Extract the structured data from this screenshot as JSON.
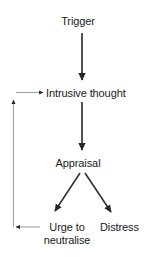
{
  "diagram": {
    "type": "flowchart",
    "title": "",
    "background_color": "#ffffff",
    "text_color": "#1a1a1a",
    "arrow_color_dark": "#262626",
    "arrow_color_light": "#9a9a9a",
    "nodes": [
      {
        "id": "trigger",
        "label": "Trigger",
        "x": 82,
        "y": 22
      },
      {
        "id": "intrusive_thought",
        "label": "Intrusive thought",
        "x": 88,
        "y": 93
      },
      {
        "id": "appraisal",
        "label": "Appraisal",
        "x": 82,
        "y": 164
      },
      {
        "id": "urge_to_neutralise",
        "label_line1": "Urge to",
        "label_line2": "neutralise",
        "x": 67,
        "y": 234
      },
      {
        "id": "distress",
        "label": "Distress",
        "x": 125,
        "y": 228
      }
    ],
    "edges": [
      {
        "from": "trigger",
        "to": "intrusive_thought",
        "style": "dark-vertical"
      },
      {
        "from": "intrusive_thought",
        "to": "appraisal",
        "style": "dark-vertical"
      },
      {
        "from": "appraisal",
        "to": "urge_to_neutralise",
        "style": "dark-diagonal"
      },
      {
        "from": "appraisal",
        "to": "distress",
        "style": "dark-diagonal"
      },
      {
        "from": "urge_to_neutralise",
        "to": "intrusive_thought",
        "style": "light-feedback-loop"
      }
    ]
  }
}
